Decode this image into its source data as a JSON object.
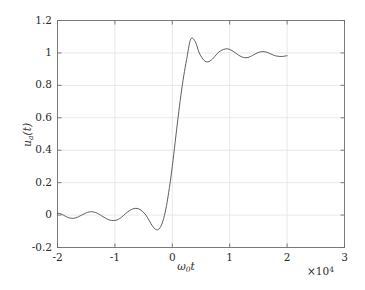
{
  "chart_data": {
    "type": "line",
    "title": "",
    "subtitle": "",
    "xlabel": "ω₀t",
    "ylabel": "uₐ(t)",
    "x_multiplier": "×10⁴",
    "x_multiplier_base": "×10",
    "x_multiplier_exponent": "4",
    "xlim": [
      -2,
      3
    ],
    "ylim": [
      -0.2,
      1.2
    ],
    "xticks": [
      -2,
      -1,
      0,
      1,
      2,
      3
    ],
    "xtick_labels": [
      "-2",
      "-1",
      "0",
      "1",
      "2",
      "3"
    ],
    "yticks": [
      -0.2,
      0,
      0.2,
      0.4,
      0.6,
      0.8,
      1,
      1.2
    ],
    "ytick_labels": [
      "-0.2",
      "0",
      "0.2",
      "0.4",
      "0.6",
      "0.8",
      "1",
      "1.2"
    ],
    "grid": true,
    "legend": null,
    "legend_position": "none",
    "series": [
      {
        "name": "u_a(t)",
        "color": "#4d4d4d",
        "line_width": 0.9,
        "x_range_drawn": [
          -2,
          2
        ],
        "description": "Band-limited unit step response showing Gibbs ringing; rises through 0.5 near x=0, overshoots to about 1.085 near x=0.32, then decaying oscillation settling toward 1. Pre-transition ripple oscillates about 0 with a dip to about -0.09 near x=-0.3.",
        "x": [
          -2.0,
          -1.93,
          -1.86,
          -1.79,
          -1.72,
          -1.65,
          -1.58,
          -1.51,
          -1.44,
          -1.37,
          -1.3,
          -1.23,
          -1.16,
          -1.09,
          -1.02,
          -0.95,
          -0.88,
          -0.81,
          -0.74,
          -0.67,
          -0.6,
          -0.53,
          -0.46,
          -0.4,
          -0.35,
          -0.3,
          -0.25,
          -0.2,
          -0.15,
          -0.1,
          -0.05,
          0.0,
          0.05,
          0.1,
          0.15,
          0.2,
          0.25,
          0.32,
          0.4,
          0.47,
          0.55,
          0.62,
          0.7,
          0.78,
          0.85,
          0.93,
          1.0,
          1.08,
          1.16,
          1.24,
          1.32,
          1.4,
          1.48,
          1.56,
          1.64,
          1.72,
          1.8,
          1.9,
          2.0
        ],
        "y": [
          0.012,
          0.006,
          -0.008,
          -0.018,
          -0.02,
          -0.013,
          0.0,
          0.012,
          0.02,
          0.019,
          0.01,
          -0.005,
          -0.02,
          -0.031,
          -0.034,
          -0.028,
          -0.012,
          0.01,
          0.029,
          0.04,
          0.04,
          0.026,
          0.0,
          -0.035,
          -0.065,
          -0.086,
          -0.09,
          -0.07,
          -0.02,
          0.06,
          0.17,
          0.3,
          0.45,
          0.6,
          0.74,
          0.86,
          0.96,
          1.085,
          1.07,
          1.0,
          0.955,
          0.945,
          0.962,
          0.995,
          1.015,
          1.025,
          1.022,
          1.005,
          0.985,
          0.972,
          0.972,
          0.985,
          1.0,
          1.008,
          1.005,
          0.993,
          0.982,
          0.978,
          0.983
        ]
      }
    ]
  },
  "figure": {
    "background_color": "#ffffff",
    "grid_color": "#e2e2e2",
    "axis_color": "#6e6e6e",
    "text_color": "#2b2b2b"
  }
}
